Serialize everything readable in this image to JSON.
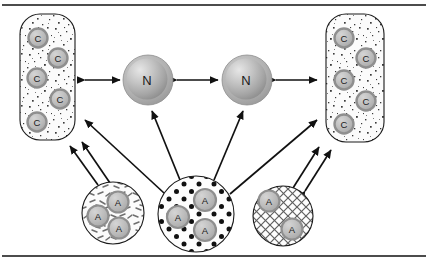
{
  "figure": {
    "frame": {
      "top_rule": "horizontal-rule",
      "bottom_rule": "horizontal-rule"
    },
    "colors": {
      "outline": "#1a1a1a",
      "node_fill_light": "#dcdcdc",
      "node_fill_mid": "#b4b4b4",
      "node_fill_dark": "#9a9a9a",
      "node_ring": "#a8a8a8",
      "label_text": "#1a1a1a",
      "panel_fill": "#fbfbfb",
      "arrow": "#111111",
      "background": "#ffffff"
    },
    "panels": [
      {
        "id": "panel-left",
        "name": "c-panel-left",
        "shape": "rounded-rectangle",
        "texture": "speckle",
        "x": 20,
        "y": 14,
        "width": 55,
        "height": 126,
        "radius": 20,
        "nodes": [
          {
            "label": "C",
            "cx": 38,
            "cy": 38,
            "r": 9.5
          },
          {
            "label": "C",
            "cx": 58,
            "cy": 58,
            "r": 9.5
          },
          {
            "label": "C",
            "cx": 37,
            "cy": 78,
            "r": 9.5
          },
          {
            "label": "C",
            "cx": 60,
            "cy": 99,
            "r": 9.5
          },
          {
            "label": "C",
            "cx": 37,
            "cy": 122,
            "r": 9.5
          }
        ]
      },
      {
        "id": "panel-right",
        "name": "c-panel-right",
        "shape": "rounded-rectangle",
        "texture": "speckle",
        "x": 326,
        "y": 14,
        "width": 58,
        "height": 128,
        "radius": 20,
        "nodes": [
          {
            "label": "C",
            "cx": 344,
            "cy": 38,
            "r": 9.5
          },
          {
            "label": "C",
            "cx": 366,
            "cy": 58,
            "r": 9.5
          },
          {
            "label": "C",
            "cx": 344,
            "cy": 80,
            "r": 9.5
          },
          {
            "label": "C",
            "cx": 366,
            "cy": 101,
            "r": 9.5
          },
          {
            "label": "C",
            "cx": 344,
            "cy": 124,
            "r": 9.5
          }
        ]
      }
    ],
    "spheres": [
      {
        "id": "sphere-n-left",
        "name": "n-node-left",
        "label": "N",
        "cx": 148,
        "cy": 80,
        "r": 25
      },
      {
        "id": "sphere-n-right",
        "name": "n-node-right",
        "label": "N",
        "cx": 247,
        "cy": 80,
        "r": 25
      }
    ],
    "circles": [
      {
        "id": "circle-a-left",
        "name": "a-circle-left",
        "texture": "dashes",
        "cx": 113,
        "cy": 213,
        "r": 31,
        "nodes": [
          {
            "label": "A",
            "cx": 118,
            "cy": 202,
            "r": 10.5
          },
          {
            "label": "A",
            "cx": 98,
            "cy": 216,
            "r": 10.5
          },
          {
            "label": "A",
            "cx": 119,
            "cy": 228,
            "r": 10.5
          }
        ]
      },
      {
        "id": "circle-a-middle",
        "name": "a-circle-middle",
        "texture": "dots",
        "cx": 196,
        "cy": 214,
        "r": 38,
        "nodes": [
          {
            "label": "A",
            "cx": 205,
            "cy": 200,
            "r": 11
          },
          {
            "label": "A",
            "cx": 178,
            "cy": 217,
            "r": 11
          },
          {
            "label": "A",
            "cx": 205,
            "cy": 230,
            "r": 11
          }
        ]
      },
      {
        "id": "circle-a-right",
        "name": "a-circle-right",
        "texture": "crosshatch",
        "cx": 283,
        "cy": 216,
        "r": 30,
        "nodes": [
          {
            "label": "A",
            "cx": 269,
            "cy": 201,
            "r": 10.5
          },
          {
            "label": "A",
            "cx": 292,
            "cy": 229,
            "r": 10.5
          }
        ]
      }
    ],
    "connections": [
      {
        "id": "arrow-panel-left-to-n-left",
        "name": "arrow-c-left-to-n-left",
        "type": "double",
        "x1": 85,
        "y1": 80,
        "x2": 120,
        "y2": 80
      },
      {
        "id": "arrow-n-left-to-n-right",
        "name": "arrow-n-left-to-n-right",
        "type": "double",
        "x1": 176,
        "y1": 80,
        "x2": 218,
        "y2": 80
      },
      {
        "id": "arrow-n-right-to-panel-right",
        "name": "arrow-n-right-to-c-right",
        "type": "double",
        "x1": 275,
        "y1": 80,
        "x2": 317,
        "y2": 80
      },
      {
        "id": "arrow-a-mid-to-n-left",
        "name": "arrow-a-middle-to-n-left",
        "type": "single",
        "x1": 178,
        "y1": 180,
        "x2": 152,
        "y2": 110
      },
      {
        "id": "arrow-a-mid-to-n-right",
        "name": "arrow-a-middle-to-n-right",
        "type": "single",
        "x1": 216,
        "y1": 180,
        "x2": 243,
        "y2": 110
      },
      {
        "id": "arrow-a-mid-to-panel-left",
        "name": "arrow-a-middle-to-c-left",
        "type": "single",
        "x1": 163,
        "y1": 192,
        "x2": 85,
        "y2": 120
      },
      {
        "id": "arrow-a-mid-to-panel-right",
        "name": "arrow-a-middle-to-c-right",
        "type": "single",
        "x1": 230,
        "y1": 193,
        "x2": 318,
        "y2": 120
      },
      {
        "id": "arrow-a-left-to-panel-left-a",
        "name": "arrow-a-left-to-c-left-outer",
        "type": "double",
        "x1": 97,
        "y1": 184,
        "x2": 71,
        "y2": 146
      },
      {
        "id": "arrow-a-left-to-panel-left-b",
        "name": "arrow-a-left-to-c-left-inner",
        "type": "double",
        "x1": 108,
        "y1": 182,
        "x2": 81,
        "y2": 142
      },
      {
        "id": "arrow-a-right-to-panel-right-a",
        "name": "arrow-a-right-to-c-right-inner",
        "type": "double",
        "x1": 294,
        "y1": 187,
        "x2": 320,
        "y2": 147
      },
      {
        "id": "arrow-a-right-to-panel-right-b",
        "name": "arrow-a-right-to-c-right-outer",
        "type": "double",
        "x1": 305,
        "y1": 190,
        "x2": 331,
        "y2": 150
      }
    ]
  }
}
